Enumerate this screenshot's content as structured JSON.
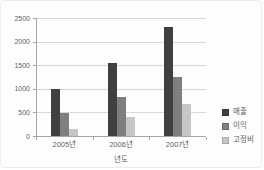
{
  "chart_style": {
    "background": "#fdfdfd",
    "border_color": "#ececec",
    "text_color": "#5f5f5f",
    "gridline_color": "#d9d9d9",
    "axis_color": "#a6a6a6"
  },
  "chart_data": {
    "type": "bar",
    "title": "",
    "xlabel": "년도",
    "ylabel": "",
    "ylim": [
      0,
      2500
    ],
    "y_tick_step": 500,
    "y_tick_labels": [
      "0",
      "500",
      "1000",
      "1500",
      "2000",
      "2500"
    ],
    "grid": true,
    "legend_position": "right",
    "categories": [
      "2005년",
      "2006년",
      "2007년"
    ],
    "series": [
      {
        "name": "매출",
        "color": "#404040",
        "values": [
          1000,
          1550,
          2300
        ]
      },
      {
        "name": "이익",
        "color": "#7f7f7f",
        "values": [
          490,
          820,
          1250
        ]
      },
      {
        "name": "고정비",
        "color": "#c6c6c6",
        "values": [
          150,
          400,
          670
        ]
      }
    ]
  }
}
